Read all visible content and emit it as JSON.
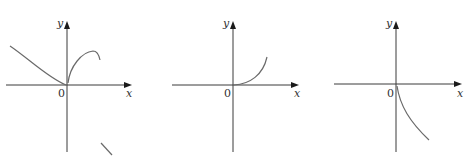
{
  "figure": {
    "panels": [
      {
        "id": "graph-1",
        "y_label": "y",
        "x_label": "x",
        "origin_label": "0",
        "description": "Left branch decreasing toward origin (concave up); right branch rising from origin with vertical tangent, peaking and turning down; separate short segment lower right"
      },
      {
        "id": "graph-2",
        "y_label": "y",
        "x_label": "x",
        "origin_label": "0",
        "description": "Curve starting at origin with horizontal tangent, increasing and concave up for x > 0"
      },
      {
        "id": "graph-3",
        "y_label": "y",
        "x_label": "x",
        "origin_label": "0",
        "description": "Curve starting at origin with vertical tangent, decreasing for x > 0"
      }
    ],
    "colors": {
      "axis": "#3a3a3a",
      "curve": "#6a6a6a",
      "label": "#333333",
      "background": "#ffffff"
    }
  }
}
